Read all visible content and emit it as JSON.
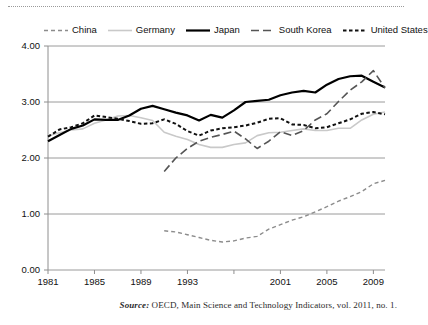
{
  "legend": {
    "items": [
      {
        "label": "China",
        "key": "china",
        "color": "#8c8c8c",
        "dash": "4,3",
        "width": 1.4
      },
      {
        "label": "Germany",
        "key": "germany",
        "color": "#c9c9c9",
        "dash": "none",
        "width": 1.6
      },
      {
        "label": "Japan",
        "key": "japan",
        "color": "#000000",
        "dash": "none",
        "width": 2.2
      },
      {
        "label": "South Korea",
        "key": "south_korea",
        "color": "#555555",
        "dash": "8,4",
        "width": 1.6
      },
      {
        "label": "United States",
        "key": "united_states",
        "color": "#111111",
        "dash": "3.5,2.5",
        "width": 2.0
      }
    ]
  },
  "axis": {
    "y_ticks": [
      "0.00",
      "1.00",
      "2.00",
      "3.00",
      "4.00"
    ],
    "x_ticks": [
      "1981",
      "1985",
      "1989",
      "1993",
      "",
      "2001",
      "2005",
      "2009"
    ]
  },
  "source": {
    "lead": "Source:",
    "text": " OECD, Main Science and Technology Indicators, vol. 2011, no. 1."
  },
  "chart_data": {
    "type": "line",
    "title": "",
    "xlabel": "",
    "ylabel": "",
    "xlim": [
      1981,
      2010
    ],
    "ylim": [
      0.0,
      4.0
    ],
    "ytick_values": [
      0.0,
      1.0,
      2.0,
      3.0,
      4.0
    ],
    "xtick_values": [
      1981,
      1985,
      1989,
      1993,
      1997,
      2001,
      2005,
      2009
    ],
    "xtick_labels": [
      "1981",
      "1985",
      "1989",
      "1993",
      "",
      "2001",
      "2005",
      "2009"
    ],
    "grid": "horizontal",
    "legend_position": "top",
    "series": [
      {
        "name": "China",
        "color": "#8c8c8c",
        "style": "dashed",
        "x": [
          1991,
          1992,
          1993,
          1994,
          1995,
          1996,
          1997,
          1998,
          1999,
          2000,
          2001,
          2002,
          2003,
          2004,
          2005,
          2006,
          2007,
          2008,
          2009,
          2010
        ],
        "values": [
          0.7,
          0.68,
          0.63,
          0.58,
          0.53,
          0.5,
          0.52,
          0.57,
          0.6,
          0.73,
          0.81,
          0.89,
          0.95,
          1.04,
          1.13,
          1.23,
          1.31,
          1.4,
          1.54,
          1.6
        ]
      },
      {
        "name": "Germany",
        "color": "#c9c9c9",
        "style": "solid",
        "x": [
          1981,
          1982,
          1983,
          1984,
          1985,
          1986,
          1987,
          1988,
          1989,
          1990,
          1991,
          1992,
          1993,
          1994,
          1995,
          1996,
          1997,
          1998,
          1999,
          2000,
          2001,
          2002,
          2003,
          2004,
          2005,
          2006,
          2007,
          2008,
          2009,
          2010
        ],
        "values": [
          2.4,
          2.45,
          2.5,
          2.52,
          2.62,
          2.68,
          2.75,
          2.76,
          2.72,
          2.67,
          2.46,
          2.39,
          2.33,
          2.24,
          2.19,
          2.19,
          2.24,
          2.27,
          2.4,
          2.45,
          2.46,
          2.49,
          2.52,
          2.49,
          2.49,
          2.53,
          2.53,
          2.68,
          2.78,
          2.82
        ]
      },
      {
        "name": "Japan",
        "color": "#000000",
        "style": "solid",
        "x": [
          1981,
          1982,
          1983,
          1984,
          1985,
          1986,
          1987,
          1988,
          1989,
          1990,
          1991,
          1992,
          1993,
          1994,
          1995,
          1996,
          1997,
          1998,
          1999,
          2000,
          2001,
          2002,
          2003,
          2004,
          2005,
          2006,
          2007,
          2008,
          2009,
          2010
        ],
        "values": [
          2.3,
          2.41,
          2.52,
          2.58,
          2.69,
          2.68,
          2.68,
          2.76,
          2.88,
          2.93,
          2.87,
          2.81,
          2.76,
          2.67,
          2.77,
          2.72,
          2.85,
          3.0,
          3.02,
          3.04,
          3.12,
          3.17,
          3.2,
          3.17,
          3.31,
          3.41,
          3.46,
          3.47,
          3.36,
          3.26
        ]
      },
      {
        "name": "South Korea",
        "color": "#555555",
        "style": "long-dashed",
        "x": [
          1991,
          1992,
          1993,
          1994,
          1995,
          1996,
          1997,
          1998,
          1999,
          2000,
          2001,
          2002,
          2003,
          2004,
          2005,
          2006,
          2007,
          2008,
          2009,
          2010
        ],
        "values": [
          1.76,
          2.0,
          2.17,
          2.3,
          2.37,
          2.42,
          2.48,
          2.34,
          2.17,
          2.3,
          2.47,
          2.4,
          2.49,
          2.68,
          2.79,
          3.01,
          3.21,
          3.36,
          3.56,
          3.25
        ]
      },
      {
        "name": "United States",
        "color": "#111111",
        "style": "dotted",
        "x": [
          1981,
          1982,
          1983,
          1984,
          1985,
          1986,
          1987,
          1988,
          1989,
          1990,
          1991,
          1992,
          1993,
          1994,
          1995,
          1996,
          1997,
          1998,
          1999,
          2000,
          2001,
          2002,
          2003,
          2004,
          2005,
          2006,
          2007,
          2008,
          2009,
          2010
        ],
        "values": [
          2.38,
          2.51,
          2.55,
          2.62,
          2.76,
          2.73,
          2.7,
          2.66,
          2.61,
          2.62,
          2.69,
          2.61,
          2.48,
          2.4,
          2.49,
          2.53,
          2.55,
          2.58,
          2.63,
          2.7,
          2.71,
          2.6,
          2.59,
          2.53,
          2.55,
          2.62,
          2.69,
          2.79,
          2.82,
          2.78
        ]
      }
    ]
  }
}
